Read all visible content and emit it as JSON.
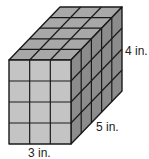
{
  "figure": {
    "type": "rectangular prism made of unit cubes",
    "dimensions": {
      "width": 3,
      "depth": 5,
      "height": 4
    },
    "labels": {
      "height": "4 in.",
      "depth": "5 in.",
      "width": "3 in."
    },
    "colors": {
      "front": "#c4c4c4",
      "top": "#a8a8a8",
      "side": "#8c8c8c",
      "stroke": "#1a1a1a"
    }
  }
}
